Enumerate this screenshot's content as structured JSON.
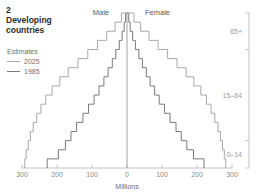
{
  "figure": {
    "number": "2",
    "title_line1": "Developing",
    "title_line2": "countries"
  },
  "legend": {
    "heading": "Estimates",
    "items": [
      {
        "label": "2025",
        "color": "#a8a8a8"
      },
      {
        "label": "1985",
        "color": "#7a7a7a"
      }
    ]
  },
  "labels": {
    "male": "Male",
    "female": "Female",
    "xaxis_title": "Millions"
  },
  "age_brackets": [
    {
      "label": "65+",
      "from_age": 65,
      "to_age": 85
    },
    {
      "label": "15–64",
      "from_age": 15,
      "to_age": 65
    },
    {
      "label": "0–14",
      "from_age": 0,
      "to_age": 15
    }
  ],
  "colors": {
    "series_2025": "#a8a8a8",
    "series_1985": "#7a7a7a",
    "axis": "#c4c4c4",
    "bracket": "#c4c4c4",
    "text": "#8a8a8a",
    "title_text": "#2b2b2b",
    "background": "#ffffff"
  },
  "chart_data": {
    "type": "bar",
    "orientation": "population-pyramid",
    "title": "2 Developing countries",
    "xlabel": "Millions",
    "ylabel": "",
    "xlim": [
      -300,
      300
    ],
    "xticks": [
      -300,
      -200,
      -100,
      0,
      100,
      200,
      300
    ],
    "xticklabels": [
      "300",
      "200",
      "100",
      "0",
      "100",
      "200",
      "300"
    ],
    "grid": false,
    "legend_position": "left",
    "left_side": "Male",
    "right_side": "Female",
    "categories": [
      "0–4",
      "5–9",
      "10–14",
      "15–19",
      "20–24",
      "25–29",
      "30–34",
      "35–39",
      "40–44",
      "45–49",
      "50–54",
      "55–59",
      "60–64",
      "65–69",
      "70–74",
      "75–79",
      "80+"
    ],
    "series": [
      {
        "name": "2025",
        "color": "#a8a8a8",
        "male": [
          292,
          288,
          282,
          276,
          268,
          258,
          246,
          232,
          214,
          192,
          168,
          140,
          112,
          84,
          58,
          34,
          16
        ],
        "female": [
          282,
          278,
          273,
          267,
          260,
          251,
          240,
          227,
          211,
          191,
          169,
          143,
          116,
          89,
          63,
          39,
          20
        ]
      },
      {
        "name": "1985",
        "color": "#7a7a7a",
        "male": [
          228,
          196,
          176,
          160,
          144,
          126,
          110,
          94,
          80,
          66,
          54,
          42,
          32,
          22,
          14,
          8,
          4
        ],
        "female": [
          220,
          190,
          171,
          155,
          140,
          123,
          107,
          92,
          79,
          66,
          55,
          44,
          34,
          24,
          16,
          9,
          5
        ]
      }
    ]
  }
}
